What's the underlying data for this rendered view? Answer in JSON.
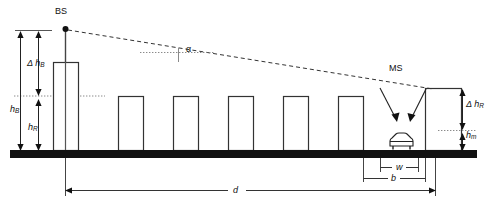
{
  "figure": {
    "type": "diagram",
    "background_color": "#ffffff",
    "line_color": "#222222",
    "ground_color": "#111111"
  },
  "labels": {
    "bs": "BS",
    "ms": "MS",
    "alpha": "α",
    "delta": "Δ",
    "h_b_base": "h",
    "h_b_sub": "B",
    "h_r_base": "h",
    "h_r_sub": "R",
    "delta_h_b_base": "h",
    "delta_h_b_sub": "B",
    "delta_h_r_base": "h",
    "delta_h_r_sub": "R",
    "h_m_base": "h",
    "h_m_sub": "m",
    "d": "d",
    "w": "w",
    "b": "b"
  },
  "geometry": {
    "ground": {
      "y": 150,
      "height": 8,
      "x_start": 10,
      "x_end": 477
    },
    "bs": {
      "mast_x": 65,
      "antenna_y": 28,
      "building_x": 53,
      "building_width": 25,
      "building_top_y": 62
    },
    "ms": {
      "car_x": 398,
      "car_y": 144,
      "label_x": 398,
      "label_y": 70
    },
    "buildings": [
      {
        "x": 118,
        "width": 25,
        "top_y": 96
      },
      {
        "x": 173,
        "width": 25,
        "top_y": 96
      },
      {
        "x": 228,
        "width": 25,
        "top_y": 96
      },
      {
        "x": 283,
        "width": 25,
        "top_y": 96
      },
      {
        "x": 338,
        "width": 25,
        "top_y": 96
      },
      {
        "x": 425,
        "width": 36,
        "top_y": 88
      }
    ],
    "rooftop_level_y": 96,
    "mobile_level_y": 130,
    "ray": {
      "x1": 66,
      "y1": 30,
      "x2": 432,
      "y2": 90
    },
    "dimensions": {
      "d": {
        "x1": 65,
        "x2": 435,
        "y": 190
      },
      "b": {
        "x1": 363,
        "x2": 425,
        "y": 178
      },
      "w": {
        "x1": 380,
        "x2": 418,
        "y": 168
      }
    }
  },
  "annotations": {
    "h_B_description": "Base station antenna height above ground",
    "h_R_description": "Mean building (roof) height",
    "delta_h_B_description": "Base station antenna height above rooftops",
    "delta_h_R_description": "Rooftop height above mobile",
    "h_m_description": "Mobile station height",
    "d_description": "Distance between base station and mobile",
    "b_description": "Building separation distance",
    "w_description": "Street width",
    "alpha_description": "Incidence angle of the ray relative to horizontal"
  }
}
